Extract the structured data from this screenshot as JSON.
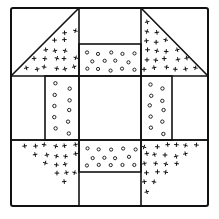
{
  "diagram": {
    "title": "",
    "type": "quilt-block",
    "pattern_description": "Churn dash style quilt block: 3x3 grid with four corner half-square triangles filled with cross marks and four side rectangles filled with small circles, center square plain",
    "colors": {
      "line": "#111111",
      "background": "#ffffff"
    },
    "outer": {
      "x1": 11,
      "y1": 8,
      "x2": 208,
      "y2": 206
    },
    "grid": {
      "v": [
        79,
        141
      ],
      "h": [
        76,
        140
      ]
    },
    "corner_triangles": [
      {
        "name": "top-left",
        "pattern": "crosses",
        "points": [
          [
            79,
            8
          ],
          [
            11,
            76
          ],
          [
            79,
            76
          ]
        ]
      },
      {
        "name": "top-right",
        "pattern": "crosses",
        "points": [
          [
            141,
            8
          ],
          [
            208,
            76
          ],
          [
            141,
            76
          ]
        ]
      },
      {
        "name": "bottom-left",
        "pattern": "crosses",
        "points": [
          [
            11,
            140
          ],
          [
            79,
            140
          ],
          [
            79,
            206
          ]
        ]
      },
      {
        "name": "bottom-right",
        "pattern": "crosses",
        "points": [
          [
            208,
            140
          ],
          [
            141,
            140
          ],
          [
            141,
            206
          ]
        ]
      }
    ],
    "side_rectangles": [
      {
        "name": "top",
        "pattern": "circles",
        "x": 79,
        "y": 44,
        "w": 62,
        "h": 32
      },
      {
        "name": "left",
        "pattern": "circles",
        "x": 45,
        "y": 76,
        "w": 34,
        "h": 64
      },
      {
        "name": "right",
        "pattern": "circles",
        "x": 141,
        "y": 76,
        "w": 31,
        "h": 64
      },
      {
        "name": "bottom",
        "pattern": "circles",
        "x": 79,
        "y": 140,
        "w": 62,
        "h": 32
      }
    ],
    "center_square": {
      "x": 79,
      "y": 76,
      "w": 62,
      "h": 64,
      "pattern": "plain"
    }
  }
}
